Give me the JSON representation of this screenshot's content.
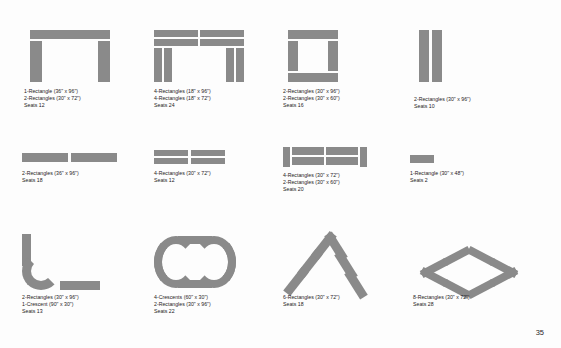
{
  "document": {
    "page_number": "35",
    "background_color": "#fdfdfd",
    "shape_color": "#8a8a8a",
    "text_color": "#1d1a1b"
  },
  "layouts": [
    {
      "id": "u-shape-single",
      "shape": "u-shape",
      "lines": [
        "1-Rectangle (36\" x 96\")",
        "2-Rectangles (30\" x 72\")",
        "Seats 12"
      ]
    },
    {
      "id": "double-u-shape",
      "shape": "double-u-shape",
      "lines": [
        "4-Rectangles (18\" x 96\")",
        "4-Rectangles (18\" x 72\")",
        "Seats 24"
      ]
    },
    {
      "id": "hollow-square",
      "shape": "hollow-rectangle",
      "lines": [
        "2-Rectangles (30\" x 96\")",
        "2-Rectangles (30\" x 60\")",
        "Seats 16"
      ]
    },
    {
      "id": "parallel-pair",
      "shape": "two-vertical-bars",
      "lines": [
        "2-Rectangles (30\" x 96\")",
        "Seats 10"
      ]
    },
    {
      "id": "classroom-two",
      "shape": "two-horizontal-bars",
      "lines": [
        "2-Rectangles (36\" x 96\")",
        "Seats 18"
      ]
    },
    {
      "id": "classroom-four",
      "shape": "two-horizontal-bars-short",
      "lines": [
        "4-Rectangles (30\" x 72\")",
        "Seats 12"
      ]
    },
    {
      "id": "classroom-grid",
      "shape": "grid-block",
      "lines": [
        "4-Rectangles (30\" x 72\")",
        "2-Rectangles (30\" x 60\")",
        "Seats 20"
      ]
    },
    {
      "id": "single-small",
      "shape": "single-bar",
      "lines": [
        "1-Rectangle (30\" x 48\")",
        "Seats 2"
      ]
    },
    {
      "id": "l-shape",
      "shape": "l-shape-crescent",
      "lines": [
        "2-Rectangles (30\" x 96\")",
        "1-Crescent (90\" x 30\")",
        "Seats 13"
      ]
    },
    {
      "id": "oval-shape",
      "shape": "oval",
      "lines": [
        "4-Crescents (60\" x 30\")",
        "2-Rectangles (30\" x 96\")",
        "Seats 22"
      ]
    },
    {
      "id": "chevron-shape",
      "shape": "diagonal-bars",
      "lines": [
        "6-Rectangles (30\" x 72\")",
        "Seats 18"
      ]
    },
    {
      "id": "diamond-shape",
      "shape": "diamond",
      "lines": [
        "8-Rectangles (30\" x 72\")",
        "Seats 28"
      ]
    }
  ]
}
